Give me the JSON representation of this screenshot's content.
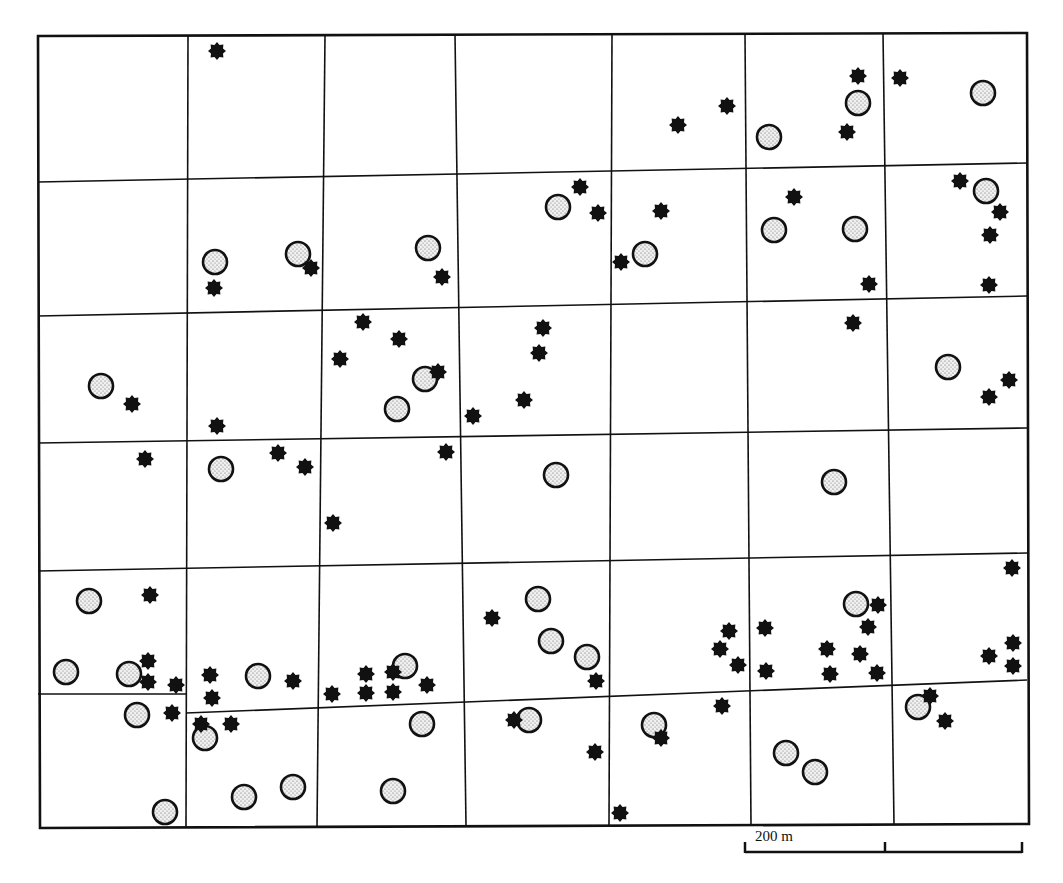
{
  "map": {
    "width": 1063,
    "height": 883,
    "frame": {
      "top_left": [
        38,
        36
      ],
      "top_right": [
        1027,
        33
      ],
      "bottom_right": [
        1029,
        824
      ],
      "bottom_left": [
        40,
        828
      ]
    },
    "vertical_lines": [
      {
        "x_top": 188,
        "x_bottom": 186,
        "y_top": 35,
        "y_bottom": 827
      },
      {
        "x_top": 325,
        "x_bottom": 317,
        "y_top": 35,
        "y_bottom": 827
      },
      {
        "x_top": 455,
        "x_bottom": 466,
        "y_top": 35,
        "y_bottom": 826
      },
      {
        "x_top": 612,
        "x_bottom": 609,
        "y_top": 34,
        "y_bottom": 826
      },
      {
        "x_top": 745,
        "x_bottom": 751,
        "y_top": 34,
        "y_bottom": 825
      },
      {
        "x_top": 883,
        "x_bottom": 894,
        "y_top": 33,
        "y_bottom": 825
      }
    ],
    "horizontal_lines": [
      {
        "x1": 38,
        "y1": 182,
        "x2": 1027,
        "y2": 163
      },
      {
        "x1": 38,
        "y1": 316,
        "x2": 1027,
        "y2": 296
      },
      {
        "x1": 38,
        "y1": 443,
        "x2": 1027,
        "y2": 428
      },
      {
        "x1": 38,
        "y1": 571,
        "x2": 1027,
        "y2": 553
      },
      {
        "x1": 38,
        "y1": 694,
        "x2": 186,
        "y2": 694
      },
      {
        "x1": 186,
        "y1": 713,
        "x2": 1027,
        "y2": 680
      }
    ],
    "legend_symbols": {
      "circle": {
        "meaning": "stippled circle site",
        "radius": 12,
        "fill": "#e6e6e6",
        "stroke": "#111111"
      },
      "star": {
        "meaning": "eight-pointed star site",
        "size": 18,
        "fill": "#111111"
      }
    },
    "circles": [
      [
        215,
        262
      ],
      [
        298,
        254
      ],
      [
        428,
        248
      ],
      [
        558,
        207
      ],
      [
        645,
        254
      ],
      [
        774,
        230
      ],
      [
        855,
        229
      ],
      [
        986,
        191
      ],
      [
        769,
        137
      ],
      [
        858,
        103
      ],
      [
        983,
        93
      ],
      [
        101,
        386
      ],
      [
        425,
        379
      ],
      [
        397,
        409
      ],
      [
        948,
        367
      ],
      [
        221,
        469
      ],
      [
        556,
        475
      ],
      [
        834,
        482
      ],
      [
        89,
        601
      ],
      [
        538,
        599
      ],
      [
        551,
        641
      ],
      [
        587,
        657
      ],
      [
        856,
        604
      ],
      [
        66,
        672
      ],
      [
        129,
        674
      ],
      [
        405,
        666
      ],
      [
        258,
        676
      ],
      [
        137,
        715
      ],
      [
        205,
        738
      ],
      [
        422,
        724
      ],
      [
        529,
        720
      ],
      [
        654,
        725
      ],
      [
        918,
        707
      ],
      [
        786,
        753
      ],
      [
        815,
        772
      ],
      [
        244,
        797
      ],
      [
        293,
        787
      ],
      [
        393,
        791
      ],
      [
        165,
        812
      ]
    ],
    "stars": [
      [
        217,
        51
      ],
      [
        858,
        76
      ],
      [
        900,
        78
      ],
      [
        727,
        106
      ],
      [
        678,
        125
      ],
      [
        847,
        132
      ],
      [
        580,
        187
      ],
      [
        598,
        213
      ],
      [
        661,
        211
      ],
      [
        794,
        197
      ],
      [
        960,
        181
      ],
      [
        1000,
        212
      ],
      [
        990,
        235
      ],
      [
        311,
        268
      ],
      [
        214,
        288
      ],
      [
        442,
        277
      ],
      [
        621,
        262
      ],
      [
        869,
        284
      ],
      [
        989,
        285
      ],
      [
        363,
        322
      ],
      [
        399,
        339
      ],
      [
        340,
        359
      ],
      [
        543,
        328
      ],
      [
        539,
        353
      ],
      [
        853,
        323
      ],
      [
        438,
        372
      ],
      [
        132,
        404
      ],
      [
        524,
        400
      ],
      [
        473,
        416
      ],
      [
        1009,
        380
      ],
      [
        989,
        397
      ],
      [
        217,
        426
      ],
      [
        145,
        459
      ],
      [
        278,
        453
      ],
      [
        305,
        467
      ],
      [
        446,
        452
      ],
      [
        333,
        523
      ],
      [
        1012,
        568
      ],
      [
        150,
        595
      ],
      [
        492,
        618
      ],
      [
        878,
        605
      ],
      [
        868,
        627
      ],
      [
        148,
        661
      ],
      [
        148,
        682
      ],
      [
        176,
        685
      ],
      [
        729,
        631
      ],
      [
        765,
        628
      ],
      [
        720,
        649
      ],
      [
        738,
        665
      ],
      [
        766,
        671
      ],
      [
        827,
        649
      ],
      [
        860,
        654
      ],
      [
        830,
        674
      ],
      [
        877,
        673
      ],
      [
        1013,
        643
      ],
      [
        989,
        656
      ],
      [
        1013,
        666
      ],
      [
        210,
        675
      ],
      [
        212,
        698
      ],
      [
        293,
        681
      ],
      [
        332,
        694
      ],
      [
        366,
        674
      ],
      [
        366,
        693
      ],
      [
        393,
        672
      ],
      [
        393,
        692
      ],
      [
        427,
        685
      ],
      [
        596,
        681
      ],
      [
        172,
        713
      ],
      [
        201,
        724
      ],
      [
        231,
        724
      ],
      [
        514,
        720
      ],
      [
        930,
        696
      ],
      [
        945,
        721
      ],
      [
        722,
        706
      ],
      [
        595,
        752
      ],
      [
        661,
        738
      ],
      [
        620,
        813
      ]
    ],
    "scale_bar": {
      "label": "200 m",
      "x_start": 745,
      "x_mid": 885,
      "x_end": 1022,
      "y": 852,
      "tick_height": 10
    }
  }
}
